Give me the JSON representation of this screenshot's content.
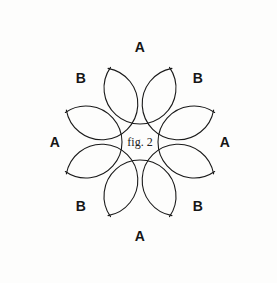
{
  "figure": {
    "caption": "fig. 2",
    "background_color": "#fdfdfc",
    "stroke_color": "#1a1a1a",
    "label_color": "#151515",
    "center_x": 140,
    "center_y": 142,
    "lobe_radius": 36,
    "lobe_orbit_radius": 54,
    "lobe_count": 8,
    "lobes": [
      {
        "label": "A",
        "angle_deg": 270,
        "position": "top",
        "x": 140,
        "y": 88,
        "label_x": 140,
        "label_y": 47
      },
      {
        "label": "B",
        "angle_deg": 315,
        "position": "top-right",
        "x": 178,
        "y": 104,
        "label_x": 198,
        "label_y": 78
      },
      {
        "label": "A",
        "angle_deg": 0,
        "position": "right",
        "x": 194,
        "y": 142,
        "label_x": 225,
        "label_y": 142
      },
      {
        "label": "B",
        "angle_deg": 45,
        "position": "bottom-right",
        "x": 178,
        "y": 180,
        "label_x": 198,
        "label_y": 206
      },
      {
        "label": "A",
        "angle_deg": 90,
        "position": "bottom",
        "x": 140,
        "y": 196,
        "label_x": 140,
        "label_y": 236
      },
      {
        "label": "B",
        "angle_deg": 135,
        "position": "bottom-left",
        "x": 102,
        "y": 180,
        "label_x": 81,
        "label_y": 206
      },
      {
        "label": "A",
        "angle_deg": 180,
        "position": "left",
        "x": 86,
        "y": 142,
        "label_x": 55,
        "label_y": 142
      },
      {
        "label": "B",
        "angle_deg": 225,
        "position": "top-left",
        "x": 102,
        "y": 104,
        "label_x": 81,
        "label_y": 78
      }
    ]
  }
}
